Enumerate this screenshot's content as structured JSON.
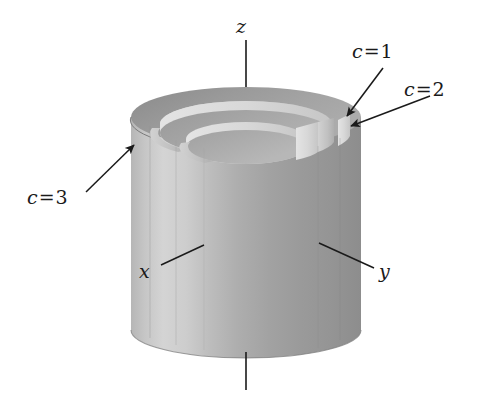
{
  "figure": {
    "type": "3d-diagram",
    "background_color": "#ffffff",
    "ink_color": "#1a1a1a"
  },
  "axes": {
    "z": {
      "label": "z",
      "orientation": "vertical",
      "line_top_y": 40,
      "line_bottom_y": 390
    },
    "x": {
      "label": "x",
      "orientation": "toward-viewer-left"
    },
    "y": {
      "label": "y",
      "orientation": "toward-viewer-right"
    }
  },
  "annotations": [
    {
      "id": "c1",
      "variable": "c",
      "relation": "=",
      "value": "1",
      "text": "c = 1",
      "arrow_tip": [
        345,
        118
      ]
    },
    {
      "id": "c2",
      "variable": "c",
      "relation": "=",
      "value": "2",
      "text": "c = 2",
      "arrow_tip": [
        349,
        128
      ]
    },
    {
      "id": "c3",
      "variable": "c",
      "relation": "=",
      "value": "3",
      "text": "c = 3",
      "arrow_tip": [
        136,
        147
      ]
    }
  ],
  "surfaces": [
    {
      "id": "shell-c1",
      "label": "c = 1",
      "radius_rank": 1,
      "description": "innermost cylindrical shell, shortest"
    },
    {
      "id": "shell-c2",
      "label": "c = 2",
      "radius_rank": 2,
      "description": "middle cylindrical shell"
    },
    {
      "id": "shell-c3",
      "label": "c = 3",
      "radius_rank": 3,
      "description": "outermost cylindrical shell, tallest"
    }
  ],
  "palette": {
    "top_annulus_outer": "#9a9a9a",
    "top_annulus_mid": "#a6a6a6",
    "top_annulus_inner": "#b0b0b0",
    "body_highlight": "#d2d2d2",
    "body_light": "#c2c2c2",
    "body_mid": "#a8a8a8",
    "body_shadow": "#8e8e8e",
    "body_dark": "#848484",
    "step_face_light": "#dcdcdc",
    "step_face_mid": "#c8c8c8",
    "rim_dark": "#8a8a8a",
    "line": "#1a1a1a"
  }
}
